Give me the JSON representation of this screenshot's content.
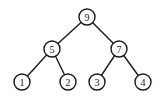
{
  "diagram": {
    "type": "binary-tree",
    "nodes": [
      {
        "id": "n9",
        "label": "9",
        "x": 87,
        "y": 17
      },
      {
        "id": "n5",
        "label": "5",
        "x": 52,
        "y": 49
      },
      {
        "id": "n7",
        "label": "7",
        "x": 119,
        "y": 49
      },
      {
        "id": "n1",
        "label": "1",
        "x": 22,
        "y": 82
      },
      {
        "id": "n2",
        "label": "2",
        "x": 68,
        "y": 82
      },
      {
        "id": "n3",
        "label": "3",
        "x": 97,
        "y": 82
      },
      {
        "id": "n4",
        "label": "4",
        "x": 143,
        "y": 82
      }
    ],
    "edges": [
      {
        "from": "n9",
        "to": "n5"
      },
      {
        "from": "n9",
        "to": "n7"
      },
      {
        "from": "n5",
        "to": "n1"
      },
      {
        "from": "n5",
        "to": "n2"
      },
      {
        "from": "n7",
        "to": "n3"
      },
      {
        "from": "n7",
        "to": "n4"
      }
    ],
    "node_radius": 8,
    "colors": {
      "stroke": "#1a1a1a",
      "fill": "#ffffff",
      "background": "#ffffff"
    }
  }
}
